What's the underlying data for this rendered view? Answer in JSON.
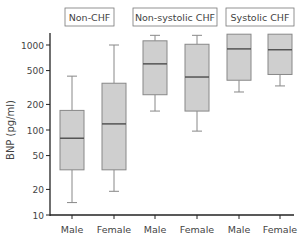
{
  "chart_data": {
    "type": "box",
    "title": "",
    "ylabel": "BNP (pg/ml)",
    "xlabel": "",
    "yscale": "log",
    "ylim": [
      10,
      1400
    ],
    "yticks": [
      10,
      20,
      50,
      100,
      200,
      500,
      1000
    ],
    "ytick_labels": [
      "10",
      "20",
      "50",
      "100",
      "200",
      "500",
      "1000"
    ],
    "groups": [
      {
        "label": "Non-CHF",
        "boxes": [
          {
            "category": "Male",
            "whisker_low": 14,
            "q1": 34,
            "median": 80,
            "q3": 170,
            "whisker_high": 430
          },
          {
            "category": "Female",
            "whisker_low": 19,
            "q1": 34,
            "median": 118,
            "q3": 355,
            "whisker_high": 1000
          }
        ]
      },
      {
        "label": "Non-systolic CHF",
        "boxes": [
          {
            "category": "Male",
            "whisker_low": 167,
            "q1": 260,
            "median": 600,
            "q3": 1120,
            "whisker_high": 1300
          },
          {
            "category": "Female",
            "whisker_low": 97,
            "q1": 167,
            "median": 420,
            "q3": 1020,
            "whisker_high": 1300
          }
        ]
      },
      {
        "label": "Systolic CHF",
        "boxes": [
          {
            "category": "Male",
            "whisker_low": 280,
            "q1": 385,
            "median": 900,
            "q3": 1340,
            "whisker_high": 1340
          },
          {
            "category": "Female",
            "whisker_low": 330,
            "q1": 450,
            "median": 880,
            "q3": 1340,
            "whisker_high": 1340
          }
        ]
      }
    ],
    "categories": [
      "Male",
      "Female",
      "Male",
      "Female",
      "Male",
      "Female"
    ],
    "colors": {
      "box_fill": "#cfcfcf",
      "box_stroke": "#888888",
      "median": "#555555",
      "axis": "#222222",
      "text": "#444444"
    },
    "grid": false,
    "legend": null
  }
}
